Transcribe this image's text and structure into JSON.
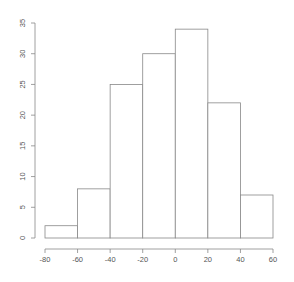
{
  "chart_data": {
    "type": "bar",
    "subtype": "histogram",
    "title": "",
    "xlabel": "",
    "ylabel": "",
    "bins": [
      {
        "from": -80,
        "to": -60,
        "count": 2
      },
      {
        "from": -60,
        "to": -40,
        "count": 8
      },
      {
        "from": -40,
        "to": -20,
        "count": 25
      },
      {
        "from": -20,
        "to": 0,
        "count": 30
      },
      {
        "from": 0,
        "to": 20,
        "count": 34
      },
      {
        "from": 20,
        "to": 40,
        "count": 22
      },
      {
        "from": 40,
        "to": 60,
        "count": 7
      }
    ],
    "categories": [
      "-80–-60",
      "-60–-40",
      "-40–-20",
      "-20–0",
      "0–20",
      "20–40",
      "40–60"
    ],
    "values": [
      2,
      8,
      25,
      30,
      34,
      22,
      7
    ],
    "xlim": [
      -80,
      60
    ],
    "ylim": [
      0,
      35
    ],
    "x_ticks": [
      "-80",
      "-60",
      "-40",
      "-20",
      "0",
      "20",
      "40",
      "60"
    ],
    "y_ticks": [
      "0",
      "5",
      "10",
      "15",
      "20",
      "25",
      "30",
      "35"
    ],
    "grid": false,
    "legend": null,
    "colors": {
      "bar_fill": "#ffffff",
      "bar_stroke": "#888888",
      "axis": "#888888",
      "text": "#555555"
    }
  }
}
